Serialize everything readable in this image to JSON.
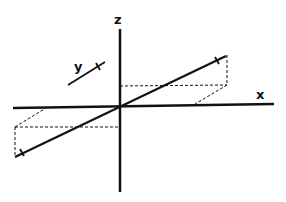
{
  "diagram": {
    "title": "",
    "axes": {
      "x_label": "x",
      "y_label": "y",
      "z_label": "z"
    },
    "colors": {
      "line": "#111111",
      "background": "#ffffff"
    }
  }
}
